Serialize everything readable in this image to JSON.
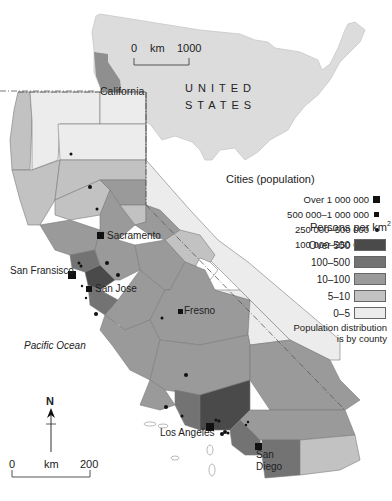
{
  "inset": {
    "country_label_line1": "UNITED",
    "country_label_line2": "STATES",
    "state_label": "California",
    "scale": {
      "start": "0",
      "unit": "km",
      "end": "1000"
    }
  },
  "main_map": {
    "ocean_label": "Pacific Ocean",
    "north_label": "N",
    "scale": {
      "start": "0",
      "unit": "km",
      "end": "200"
    },
    "cities": [
      {
        "name": "Sacramento",
        "size_class": "500000-1000000"
      },
      {
        "name": "San Fransisco",
        "size_class": "Over 1000000"
      },
      {
        "name": "San Jose",
        "size_class": "500000-1000000"
      },
      {
        "name": "Fresno",
        "size_class": "250000-500000"
      },
      {
        "name": "Los Angeles",
        "size_class": "Over 1000000"
      },
      {
        "name": "San Diego",
        "size_class": "Over 1000000"
      }
    ],
    "city_label_la": "Los Angeles",
    "city_label_sd_line1": "San",
    "city_label_sd_line2": "Diego"
  },
  "legend_cities": {
    "title": "Cities (population)",
    "items": [
      {
        "label": "Over 1 000 000",
        "symbol": "large-square"
      },
      {
        "label": "500 000–1 000 000",
        "symbol": "small-square"
      },
      {
        "label": "250 000–500 000",
        "symbol": "dot"
      },
      {
        "label": "100 000–250 000",
        "symbol": "small-dot"
      }
    ]
  },
  "legend_density": {
    "title": "Persons per km",
    "title_sup": "2",
    "items": [
      {
        "label": "Over 500",
        "color": "#4a4a4a"
      },
      {
        "label": "100–500",
        "color": "#737373"
      },
      {
        "label": "10–100",
        "color": "#9a9a9a"
      },
      {
        "label": "5–10",
        "color": "#c2c2c2"
      },
      {
        "label": "0–5",
        "color": "#ececec"
      }
    ],
    "note_line1": "Population distribution",
    "note_line2": "is by county"
  },
  "colors": {
    "us_fill": "#dcdcdc",
    "ca_inset_fill": "#8f8f8f",
    "ocean": "#ffffff"
  }
}
